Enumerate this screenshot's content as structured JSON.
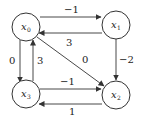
{
  "diagram": {
    "type": "directed weighted graph",
    "nodes": [
      {
        "id": "x0",
        "label": "x",
        "sub": "0",
        "cx": 26,
        "cy": 27
      },
      {
        "id": "x1",
        "label": "x",
        "sub": "1",
        "cx": 116,
        "cy": 25
      },
      {
        "id": "x2",
        "label": "x",
        "sub": "2",
        "cx": 116,
        "cy": 95
      },
      {
        "id": "x3",
        "label": "x",
        "sub": "3",
        "cx": 26,
        "cy": 94
      }
    ],
    "edges": [
      {
        "from": "x0",
        "to": "x1",
        "weight": "−1"
      },
      {
        "from": "x1",
        "to": "x0",
        "weight": "3"
      },
      {
        "from": "x1",
        "to": "x2",
        "weight": "−2"
      },
      {
        "from": "x0",
        "to": "x2",
        "weight": "0"
      },
      {
        "from": "x0",
        "to": "x3",
        "weight": "0"
      },
      {
        "from": "x3",
        "to": "x0",
        "weight": "3"
      },
      {
        "from": "x3",
        "to": "x2",
        "weight": "−1"
      },
      {
        "from": "x2",
        "to": "x3",
        "weight": "1"
      }
    ]
  }
}
